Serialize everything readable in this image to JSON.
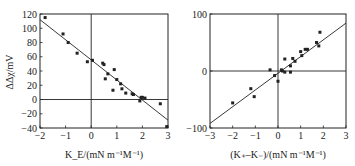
{
  "chart_data": [
    {
      "type": "scatter",
      "title": "",
      "xlabel": "K_E/(mN m^-1 M^-1)",
      "xlabel_main": "K",
      "xlabel_sub": "E",
      "xlabel_rest": "/(mN m",
      "ylabel": "ΔΔχ/mV",
      "xlim": [
        -2,
        3
      ],
      "ylim": [
        -40,
        120
      ],
      "xticks": [
        -2,
        -1,
        0,
        1,
        2,
        3
      ],
      "yticks": [
        -40,
        -20,
        0,
        20,
        40,
        60,
        80,
        100,
        120
      ],
      "grid": false,
      "zero_lines": true,
      "points": [
        [
          -1.8,
          115
        ],
        [
          -1.1,
          92
        ],
        [
          -0.9,
          80
        ],
        [
          -0.55,
          65
        ],
        [
          -0.15,
          53
        ],
        [
          0.05,
          55
        ],
        [
          0.45,
          51
        ],
        [
          0.5,
          49
        ],
        [
          0.55,
          29
        ],
        [
          0.65,
          36
        ],
        [
          0.85,
          13
        ],
        [
          0.9,
          42
        ],
        [
          1.0,
          28
        ],
        [
          1.15,
          22
        ],
        [
          1.2,
          15
        ],
        [
          1.35,
          9
        ],
        [
          1.6,
          8
        ],
        [
          1.65,
          7
        ],
        [
          1.9,
          -2
        ],
        [
          1.95,
          3
        ],
        [
          2.0,
          3
        ],
        [
          2.1,
          2
        ],
        [
          2.7,
          -6
        ],
        [
          2.95,
          -38
        ]
      ],
      "fit_line": [
        [
          -2,
          112
        ],
        [
          3,
          -29
        ]
      ]
    },
    {
      "type": "scatter",
      "title": "",
      "xlabel": "(K_+ − K_−)/(mN m^-1 M^-1)",
      "ylabel": "",
      "xlim": [
        -3,
        3
      ],
      "ylim": [
        -100,
        100
      ],
      "xticks": [
        -3,
        -2,
        -1,
        0,
        1,
        2,
        3
      ],
      "yticks": [
        -100,
        0,
        100
      ],
      "grid": false,
      "zero_lines": true,
      "points": [
        [
          -2.0,
          -56
        ],
        [
          -1.2,
          -31
        ],
        [
          -1.05,
          -45
        ],
        [
          -0.35,
          2
        ],
        [
          -0.15,
          -8
        ],
        [
          0.0,
          -18
        ],
        [
          0.15,
          2
        ],
        [
          0.2,
          0
        ],
        [
          0.3,
          21
        ],
        [
          0.3,
          -2
        ],
        [
          0.55,
          9
        ],
        [
          0.55,
          -2
        ],
        [
          0.65,
          22
        ],
        [
          0.75,
          17
        ],
        [
          1.0,
          34
        ],
        [
          1.05,
          27
        ],
        [
          1.2,
          38
        ],
        [
          1.3,
          38
        ],
        [
          1.7,
          50
        ],
        [
          1.8,
          44
        ],
        [
          1.85,
          68
        ]
      ],
      "fit_line": [
        [
          -3,
          -92
        ],
        [
          3,
          84
        ]
      ]
    }
  ],
  "labels": {
    "left_ylabel": "ΔΔχ/mV",
    "left_xlabel": "K_E/(mN m⁻¹M⁻¹)",
    "right_xlabel": "(K₊–K₋)/(mN m⁻¹M⁻¹)"
  },
  "colors": {
    "ink": "#222222",
    "background": "#ffffff"
  }
}
